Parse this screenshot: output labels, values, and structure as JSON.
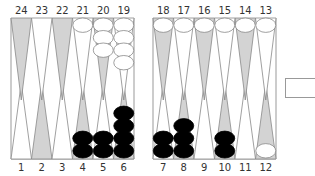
{
  "board": {
    "top_labels": [
      "24",
      "23",
      "22",
      "21",
      "20",
      "19",
      "18",
      "17",
      "16",
      "15",
      "14",
      "13"
    ],
    "bottom_labels": [
      "1",
      "2",
      "3",
      "4",
      "5",
      "6",
      "7",
      "8",
      "9",
      "10",
      "11",
      "12"
    ],
    "colors": {
      "light_point": "#ffffff",
      "dark_point": "#d3d3d3",
      "point_stroke": "#888888",
      "white_checker": "#ffffff",
      "black_checker": "#000000",
      "frame": "#999999"
    },
    "checkers": {
      "white": {
        "21": 1,
        "20": 3,
        "19": 4,
        "18": 1,
        "17": 1,
        "16": 1,
        "15": 1,
        "14": 1,
        "13": 1,
        "12": 1
      },
      "black": {
        "4": 2,
        "5": 2,
        "6": 4,
        "7": 2,
        "8": 3,
        "10": 2
      }
    }
  },
  "side_box": {
    "label": ""
  }
}
